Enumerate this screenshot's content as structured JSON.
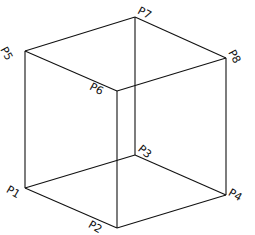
{
  "diagram": {
    "type": "wireframe-cube",
    "line_color": "#111111",
    "background": "#ffffff",
    "vertices": [
      {
        "id": "P1",
        "label": "P1",
        "x": 25,
        "y": 188
      },
      {
        "id": "P2",
        "label": "P2",
        "x": 117,
        "y": 228
      },
      {
        "id": "P3",
        "label": "P3",
        "x": 135,
        "y": 155
      },
      {
        "id": "P4",
        "label": "P4",
        "x": 226,
        "y": 195
      },
      {
        "id": "P5",
        "label": "P5",
        "x": 25,
        "y": 51
      },
      {
        "id": "P6",
        "label": "P6",
        "x": 117,
        "y": 91
      },
      {
        "id": "P7",
        "label": "P7",
        "x": 135,
        "y": 17
      },
      {
        "id": "P8",
        "label": "P8",
        "x": 226,
        "y": 58
      }
    ],
    "edges": [
      [
        "P1",
        "P2"
      ],
      [
        "P1",
        "P3"
      ],
      [
        "P3",
        "P4"
      ],
      [
        "P2",
        "P4"
      ],
      [
        "P5",
        "P6"
      ],
      [
        "P5",
        "P7"
      ],
      [
        "P7",
        "P8"
      ],
      [
        "P6",
        "P8"
      ],
      [
        "P1",
        "P5"
      ],
      [
        "P2",
        "P6"
      ],
      [
        "P3",
        "P7"
      ],
      [
        "P4",
        "P8"
      ]
    ],
    "labels": {
      "p1": "P1",
      "p2": "P2",
      "p3": "P3",
      "p4": "P4",
      "p5": "P5",
      "p6": "P6",
      "p7": "P7",
      "p8": "P8"
    }
  }
}
